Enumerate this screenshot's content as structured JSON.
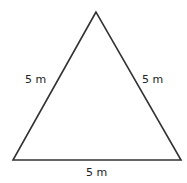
{
  "diagram": {
    "shape": "equilateral-triangle",
    "vertices": {
      "top": [
        96,
        12
      ],
      "bottom_left": [
        13,
        160
      ],
      "bottom_right": [
        181,
        160
      ]
    },
    "stroke_color": "#333333",
    "labels": {
      "left_side": "5 m",
      "right_side": "5 m",
      "bottom_side": "5 m"
    }
  }
}
